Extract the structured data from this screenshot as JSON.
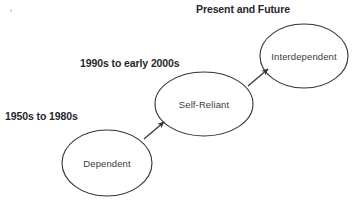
{
  "diagram": {
    "title_text_present": false,
    "background_color": "#ffffff",
    "stroke_color": "#333338",
    "nodes": [
      {
        "id": "dependent",
        "label": "Dependent",
        "cx": 107,
        "cy": 163,
        "rx": 45,
        "ry": 33
      },
      {
        "id": "self-reliant",
        "label": "Self-Reliant",
        "cx": 204,
        "cy": 104,
        "rx": 49,
        "ry": 32
      },
      {
        "id": "interdependent",
        "label": "Interdependent",
        "cx": 304,
        "cy": 56,
        "rx": 44,
        "ry": 32
      }
    ],
    "era_labels": [
      {
        "id": "era-1",
        "text": "1950s to 1980s",
        "x": 5,
        "y": 110
      },
      {
        "id": "era-2",
        "text": "1990s to early 2000s",
        "x": 80,
        "y": 57
      },
      {
        "id": "era-3",
        "text": "Present and Future",
        "x": 196,
        "y": 3
      }
    ],
    "arrows": [
      {
        "id": "arrow-dependent-to-self-reliant",
        "from": "dependent",
        "to": "self-reliant",
        "x1": 144,
        "y1": 139,
        "x2": 164,
        "y2": 122
      },
      {
        "id": "arrow-self-reliant-to-interdependent",
        "from": "self-reliant",
        "to": "interdependent",
        "x1": 248,
        "y1": 86,
        "x2": 268,
        "y2": 69
      }
    ]
  }
}
